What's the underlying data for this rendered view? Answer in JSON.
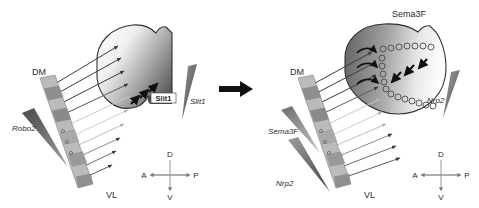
{
  "figure": {
    "type": "two-panel schematic diagram",
    "background_color": "#ffffff",
    "ink_color": "#2b2b2b"
  },
  "transition_arrow": {
    "name": "panel-transition-arrow",
    "direction": "right",
    "color": "#111111"
  },
  "left_panel": {
    "retina": {
      "label_dorsomedial": "DM",
      "label_ventrolateral": "VL",
      "segment_colors": [
        "#b8b8b8",
        "#8f8f8f",
        "#a6a6a6",
        "#8a8a8a",
        "#c2c2c2",
        "#b0b0b0",
        "#9a9a9a",
        "#8e8e8e",
        "#a8a8a8",
        "#bdbdbd"
      ]
    },
    "tectum": {
      "name": "optic-tectum-lobe",
      "gradient_light": "#f2f2f2",
      "gradient_dark": "#5c5c5c"
    },
    "molecule_inside_label": "Slit1",
    "gradient_wedge_right": {
      "label": "Slit1",
      "color": "#5e5e5e"
    },
    "gradient_wedge_left": {
      "label": "Robo2",
      "color": "#555555"
    },
    "arrows_in_tectum": {
      "count": 3,
      "direction": "up-right",
      "color": "#111111"
    },
    "compass": {
      "dorsal": "D",
      "ventral": "V",
      "anterior": "A",
      "posterior": "P"
    }
  },
  "right_panel": {
    "retina": {
      "label_dorsomedial": "DM",
      "label_ventrolateral": "VL",
      "segment_colors": [
        "#b8b8b8",
        "#8f8f8f",
        "#a6a6a6",
        "#8a8a8a",
        "#c2c2c2",
        "#b0b0b0",
        "#9a9a9a",
        "#8e8e8e",
        "#a8a8a8",
        "#bdbdbd"
      ]
    },
    "tectum": {
      "name": "optic-tectum-lobe",
      "gradient_light": "#f4f4f4",
      "gradient_dark": "#6a6a6a"
    },
    "molecule_top_label": "Sema3F",
    "gradient_wedge_right": {
      "label": "Nrp2",
      "color": "#6a6a6a"
    },
    "gradient_wedge_left_upper": {
      "label": "Sema3F",
      "color": "#8d8d8d"
    },
    "gradient_wedge_left_lower": {
      "label": "Nrp2",
      "color": "#6f6f6f"
    },
    "arrows_in_tectum": {
      "count": 3,
      "direction": "down-left",
      "color": "#111111"
    },
    "hook_arrows": {
      "count": 3,
      "description": "curved recoil arrows at tectum entry"
    },
    "circle_chains": {
      "description": "open circles marking axon terminal positions",
      "count": 28
    },
    "compass": {
      "dorsal": "D",
      "ventral": "V",
      "anterior": "A",
      "posterior": "P"
    }
  }
}
